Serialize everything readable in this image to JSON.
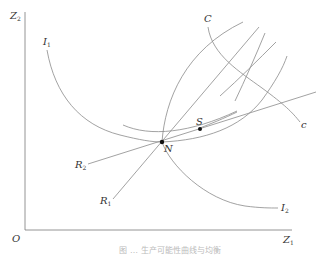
{
  "figure": {
    "type": "economics-diagram",
    "axes": {
      "x_label": "Z",
      "x_label_sub": "1",
      "y_label": "Z",
      "y_label_sub": "2",
      "origin_label": "O"
    },
    "curves": {
      "I1": {
        "label": "I",
        "sub": "1"
      },
      "I2": {
        "label": "I",
        "sub": "2"
      },
      "R1": {
        "label": "R",
        "sub": "1"
      },
      "R2": {
        "label": "R",
        "sub": "2"
      },
      "contract_start": {
        "label": "C"
      },
      "contract_end": {
        "label": "c"
      }
    },
    "points": {
      "N": {
        "label": "N"
      },
      "S": {
        "label": "S"
      }
    },
    "caption": "图 … 生产可能性曲线与均衡"
  },
  "colors": {
    "line": "#8a8a8a",
    "axis": "#7a7a7a",
    "point": "#111111",
    "text": "#333333"
  }
}
